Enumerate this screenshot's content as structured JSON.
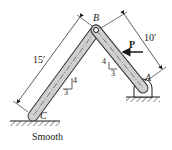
{
  "diagram": {
    "points": {
      "A": {
        "label": "A"
      },
      "B": {
        "label": "B"
      },
      "C": {
        "label": "C"
      }
    },
    "dimensions": {
      "BC_length": "15′",
      "AB_length": "10′"
    },
    "load": {
      "label": "P",
      "direction": "horizontal-left"
    },
    "slopes": {
      "BC": {
        "rise": "4",
        "run": "3"
      },
      "AB": {
        "rise": "4",
        "run": "3"
      }
    },
    "support_C": {
      "label": "Smooth"
    },
    "colors": {
      "member_fill": "#cfcfcf",
      "member_stroke": "#333333",
      "line": "#1a1a1a"
    }
  }
}
